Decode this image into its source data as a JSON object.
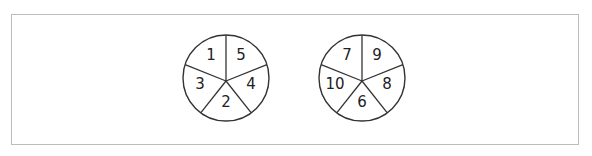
{
  "spinners": [
    {
      "id": "spinner-a",
      "center": [
        226,
        78
      ],
      "radius": 43,
      "sections": [
        {
          "label": "1",
          "pos": [
            211,
            55
          ]
        },
        {
          "label": "5",
          "pos": [
            241,
            55
          ]
        },
        {
          "label": "4",
          "pos": [
            251,
            84
          ]
        },
        {
          "label": "2",
          "pos": [
            226,
            102
          ]
        },
        {
          "label": "3",
          "pos": [
            200,
            84
          ]
        }
      ]
    },
    {
      "id": "spinner-b",
      "center": [
        362,
        78
      ],
      "radius": 43,
      "sections": [
        {
          "label": "7",
          "pos": [
            347,
            55
          ]
        },
        {
          "label": "9",
          "pos": [
            377,
            55
          ]
        },
        {
          "label": "8",
          "pos": [
            387,
            84
          ]
        },
        {
          "label": "6",
          "pos": [
            362,
            102
          ]
        },
        {
          "label": "10",
          "pos": [
            335,
            84
          ]
        }
      ]
    }
  ],
  "colors": {
    "stroke": "#333333",
    "frame": "#bdbdbd",
    "text": "#222222"
  }
}
